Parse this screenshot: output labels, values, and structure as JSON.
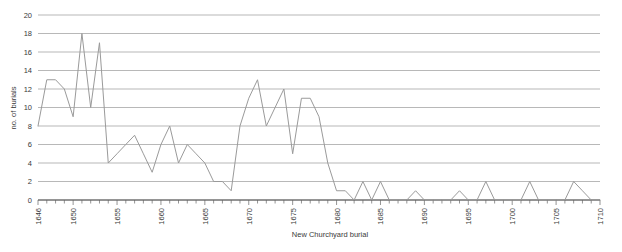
{
  "chart_data": {
    "type": "line",
    "title": "",
    "xlabel": "New Churchyard burial",
    "ylabel": "no. of burials",
    "xlim": [
      1646,
      1710
    ],
    "ylim": [
      0,
      20
    ],
    "grid": true,
    "legend": "none",
    "line_color": "#9a9a9a",
    "grid_color": "#999999",
    "axis_color": "#666666",
    "background": "#ffffff",
    "ytick_step": 2,
    "yticks": [
      0,
      2,
      4,
      6,
      8,
      10,
      12,
      14,
      16,
      18,
      20
    ],
    "ytick_labels": [
      "0",
      "2",
      "4",
      "6",
      "8",
      "10",
      "12",
      "14",
      "16",
      "18",
      "20"
    ],
    "xticks": [
      1646,
      1650,
      1655,
      1660,
      1665,
      1670,
      1675,
      1680,
      1685,
      1690,
      1695,
      1700,
      1705,
      1710
    ],
    "xtick_labels": [
      "1646",
      "1650",
      "1655",
      "1660",
      "1665",
      "1670",
      "1675",
      "1680",
      "1685",
      "1690",
      "1695",
      "1700",
      "1705",
      "1710"
    ],
    "xtick_minor_step": 1,
    "x": [
      1646,
      1647,
      1648,
      1649,
      1650,
      1651,
      1652,
      1653,
      1654,
      1655,
      1656,
      1657,
      1658,
      1659,
      1660,
      1661,
      1662,
      1663,
      1664,
      1665,
      1666,
      1667,
      1668,
      1669,
      1670,
      1671,
      1672,
      1673,
      1674,
      1675,
      1676,
      1677,
      1678,
      1679,
      1680,
      1681,
      1682,
      1683,
      1684,
      1685,
      1686,
      1687,
      1688,
      1689,
      1690,
      1691,
      1692,
      1693,
      1694,
      1695,
      1696,
      1697,
      1698,
      1699,
      1700,
      1701,
      1702,
      1703,
      1704,
      1705,
      1706,
      1707,
      1708,
      1709,
      1710
    ],
    "values": [
      8,
      13,
      13,
      12,
      9,
      18,
      10,
      17,
      4,
      5,
      6,
      7,
      5,
      3,
      6,
      8,
      4,
      6,
      5,
      4,
      2,
      2,
      1,
      8,
      11,
      13,
      8,
      10,
      12,
      5,
      11,
      11,
      9,
      4,
      1,
      1,
      0,
      2,
      0,
      2,
      0,
      0,
      0,
      1,
      0,
      0,
      0,
      0,
      1,
      0,
      0,
      2,
      0,
      0,
      0,
      0,
      2,
      0,
      0,
      0,
      0,
      2,
      1,
      0,
      0
    ],
    "series": [
      {
        "name": "New Churchyard burial",
        "values": [
          8,
          13,
          13,
          12,
          9,
          18,
          10,
          17,
          4,
          5,
          6,
          7,
          5,
          3,
          6,
          8,
          4,
          6,
          5,
          4,
          2,
          2,
          1,
          8,
          11,
          13,
          8,
          10,
          12,
          5,
          11,
          11,
          9,
          4,
          1,
          1,
          0,
          2,
          0,
          2,
          0,
          0,
          0,
          1,
          0,
          0,
          0,
          0,
          1,
          0,
          0,
          2,
          0,
          0,
          0,
          0,
          2,
          0,
          0,
          0,
          0,
          2,
          1,
          0,
          0
        ]
      }
    ]
  }
}
